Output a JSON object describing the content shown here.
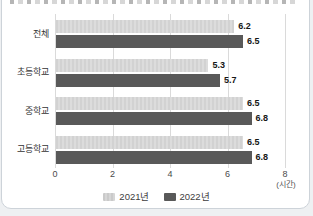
{
  "chart_data": {
    "type": "bar",
    "orientation": "horizontal",
    "categories": [
      "전체",
      "초등학교",
      "중학교",
      "고등학교"
    ],
    "series": [
      {
        "name": "2021년",
        "color": "#d6d6d6",
        "values": [
          6.2,
          5.3,
          6.5,
          6.5
        ]
      },
      {
        "name": "2022년",
        "color": "#595959",
        "values": [
          6.5,
          5.7,
          6.8,
          6.8
        ]
      }
    ],
    "xlabel": "(시간)",
    "xticks": [
      0,
      2,
      4,
      6,
      8
    ],
    "xlim": [
      0,
      8
    ],
    "value_labels": true,
    "grid": true,
    "legend_position": "bottom"
  }
}
